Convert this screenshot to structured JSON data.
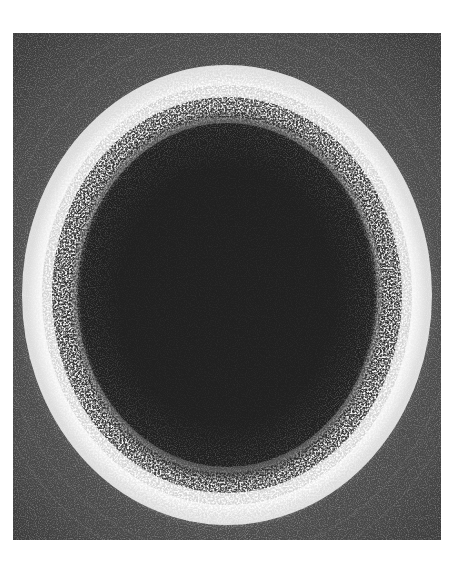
{
  "image": {
    "description": "Grayscale photograph of a speckled bright ring surrounding a dark circular center",
    "colors": {
      "background": "#ffffff",
      "outer_field": "#4a4a4a",
      "ring": "#f2f2f2",
      "center": "#1e1e1e"
    }
  }
}
